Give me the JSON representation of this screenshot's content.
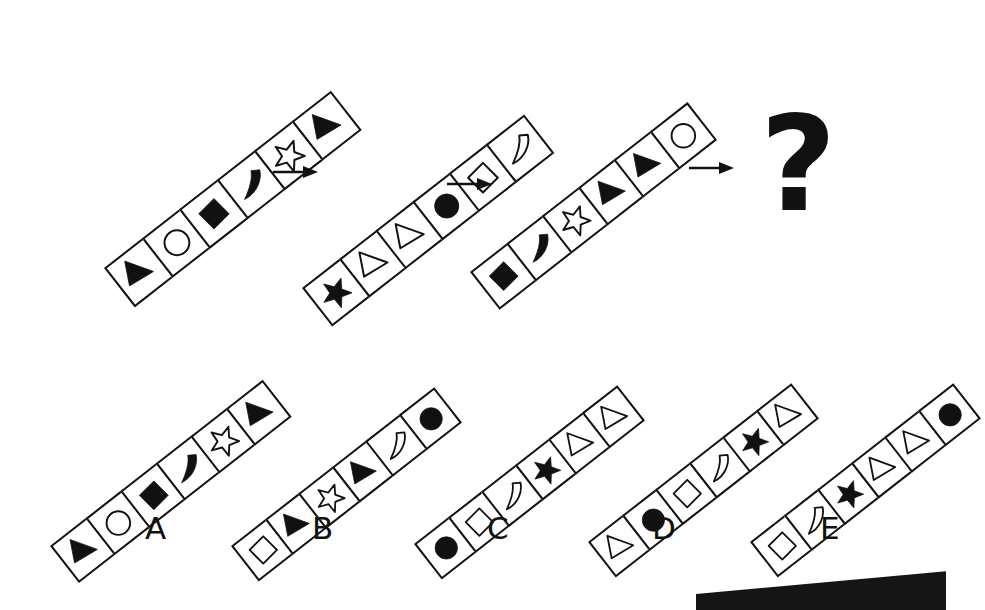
{
  "puzzle": {
    "title": "Abstract sequence reasoning puzzle",
    "question_mark": "?",
    "arrow_icon": "arrow-right-icon",
    "ink_color": "#111111",
    "paper_color": "#ffffff",
    "cells_per_bar": 6,
    "bar_rotation_deg": -38
  },
  "sequence": {
    "panels": [
      {
        "index": 1,
        "name": "sequence-panel-1",
        "shapes": [
          {
            "shape": "triangle",
            "fill": "solid",
            "name": "filled-triangle-icon"
          },
          {
            "shape": "circle",
            "fill": "outline",
            "name": "empty-circle-icon"
          },
          {
            "shape": "diamond",
            "fill": "solid",
            "name": "filled-diamond-icon"
          },
          {
            "shape": "crescent",
            "fill": "solid",
            "name": "filled-crescent-icon"
          },
          {
            "shape": "star",
            "fill": "outline",
            "name": "empty-star-icon"
          },
          {
            "shape": "triangle",
            "fill": "solid",
            "name": "filled-triangle-icon"
          }
        ]
      },
      {
        "index": 2,
        "name": "sequence-panel-2",
        "shapes": [
          {
            "shape": "star",
            "fill": "solid",
            "name": "filled-star-icon"
          },
          {
            "shape": "triangle",
            "fill": "outline",
            "name": "empty-triangle-icon"
          },
          {
            "shape": "triangle",
            "fill": "outline",
            "name": "empty-triangle-icon"
          },
          {
            "shape": "circle",
            "fill": "solid",
            "name": "filled-circle-icon"
          },
          {
            "shape": "diamond",
            "fill": "outline",
            "name": "empty-diamond-icon"
          },
          {
            "shape": "crescent",
            "fill": "outline",
            "name": "empty-crescent-icon"
          }
        ]
      },
      {
        "index": 3,
        "name": "sequence-panel-3",
        "shapes": [
          {
            "shape": "diamond",
            "fill": "solid",
            "name": "filled-diamond-icon"
          },
          {
            "shape": "crescent",
            "fill": "solid",
            "name": "filled-crescent-icon"
          },
          {
            "shape": "star",
            "fill": "outline",
            "name": "empty-star-icon"
          },
          {
            "shape": "triangle",
            "fill": "solid",
            "name": "filled-triangle-icon"
          },
          {
            "shape": "triangle",
            "fill": "solid",
            "name": "filled-triangle-icon"
          },
          {
            "shape": "circle",
            "fill": "outline",
            "name": "empty-circle-icon"
          }
        ]
      }
    ],
    "arrows": [
      {
        "name": "sequence-arrow-1",
        "label": "arrow-right-icon"
      },
      {
        "name": "sequence-arrow-2",
        "label": "arrow-right-icon"
      },
      {
        "name": "sequence-arrow-3",
        "label": "arrow-right-icon"
      }
    ]
  },
  "options": [
    {
      "label": "A",
      "name": "answer-option-a",
      "shapes": [
        {
          "shape": "triangle",
          "fill": "solid",
          "name": "filled-triangle-icon"
        },
        {
          "shape": "circle",
          "fill": "outline",
          "name": "empty-circle-icon"
        },
        {
          "shape": "diamond",
          "fill": "solid",
          "name": "filled-diamond-icon"
        },
        {
          "shape": "crescent",
          "fill": "solid",
          "name": "filled-crescent-icon"
        },
        {
          "shape": "star",
          "fill": "outline",
          "name": "empty-star-icon"
        },
        {
          "shape": "triangle",
          "fill": "solid",
          "name": "filled-triangle-icon"
        }
      ]
    },
    {
      "label": "B",
      "name": "answer-option-b",
      "shapes": [
        {
          "shape": "diamond",
          "fill": "outline",
          "name": "empty-diamond-icon"
        },
        {
          "shape": "triangle",
          "fill": "solid",
          "name": "filled-triangle-icon"
        },
        {
          "shape": "star",
          "fill": "outline",
          "name": "empty-star-icon"
        },
        {
          "shape": "triangle",
          "fill": "solid",
          "name": "filled-triangle-icon"
        },
        {
          "shape": "crescent",
          "fill": "outline",
          "name": "empty-crescent-icon"
        },
        {
          "shape": "circle",
          "fill": "solid",
          "name": "filled-circle-icon"
        }
      ]
    },
    {
      "label": "C",
      "name": "answer-option-c",
      "shapes": [
        {
          "shape": "circle",
          "fill": "solid",
          "name": "filled-circle-icon"
        },
        {
          "shape": "diamond",
          "fill": "outline",
          "name": "empty-diamond-icon"
        },
        {
          "shape": "crescent",
          "fill": "outline",
          "name": "empty-crescent-icon"
        },
        {
          "shape": "star",
          "fill": "solid",
          "name": "filled-star-icon"
        },
        {
          "shape": "triangle",
          "fill": "outline",
          "name": "empty-triangle-icon"
        },
        {
          "shape": "triangle",
          "fill": "outline",
          "name": "empty-triangle-icon"
        }
      ]
    },
    {
      "label": "D",
      "name": "answer-option-d",
      "shapes": [
        {
          "shape": "triangle",
          "fill": "outline",
          "name": "empty-triangle-icon"
        },
        {
          "shape": "circle",
          "fill": "solid",
          "name": "filled-circle-icon"
        },
        {
          "shape": "diamond",
          "fill": "outline",
          "name": "empty-diamond-icon"
        },
        {
          "shape": "crescent",
          "fill": "outline",
          "name": "empty-crescent-icon"
        },
        {
          "shape": "star",
          "fill": "solid",
          "name": "filled-star-icon"
        },
        {
          "shape": "triangle",
          "fill": "outline",
          "name": "empty-triangle-icon"
        }
      ]
    },
    {
      "label": "E",
      "name": "answer-option-e",
      "shapes": [
        {
          "shape": "diamond",
          "fill": "outline",
          "name": "empty-diamond-icon"
        },
        {
          "shape": "crescent",
          "fill": "outline",
          "name": "empty-crescent-icon"
        },
        {
          "shape": "star",
          "fill": "solid",
          "name": "filled-star-icon"
        },
        {
          "shape": "triangle",
          "fill": "outline",
          "name": "empty-triangle-icon"
        },
        {
          "shape": "triangle",
          "fill": "outline",
          "name": "empty-triangle-icon"
        },
        {
          "shape": "circle",
          "fill": "solid",
          "name": "filled-circle-icon"
        }
      ]
    }
  ],
  "layout": {
    "sequence_bars": [
      {
        "x": 104,
        "y": 268,
        "cell": 50,
        "rot": -38
      },
      {
        "x": 302,
        "y": 288,
        "cell": 49,
        "rot": -38
      },
      {
        "x": 470,
        "y": 272,
        "cell": 48,
        "rot": -38
      }
    ],
    "arrows": [
      {
        "x": 272,
        "y": 164,
        "w": 46
      },
      {
        "x": 446,
        "y": 176,
        "w": 46
      },
      {
        "x": 688,
        "y": 160,
        "w": 46
      }
    ],
    "question_mark": {
      "x": 760,
      "y": 98,
      "size": 132
    },
    "option_bars": [
      {
        "x": 50,
        "y": 546,
        "cell": 47,
        "rot": -38
      },
      {
        "x": 231,
        "y": 546,
        "cell": 45,
        "rot": -38
      },
      {
        "x": 414,
        "y": 544,
        "cell": 45,
        "rot": -38
      },
      {
        "x": 588,
        "y": 542,
        "cell": 45,
        "rot": -38
      },
      {
        "x": 750,
        "y": 542,
        "cell": 45,
        "rot": -38
      }
    ],
    "option_labels": [
      {
        "x": 145,
        "y": 513
      },
      {
        "x": 312,
        "y": 513
      },
      {
        "x": 487,
        "y": 513
      },
      {
        "x": 652,
        "y": 513
      },
      {
        "x": 820,
        "y": 513
      }
    ]
  }
}
